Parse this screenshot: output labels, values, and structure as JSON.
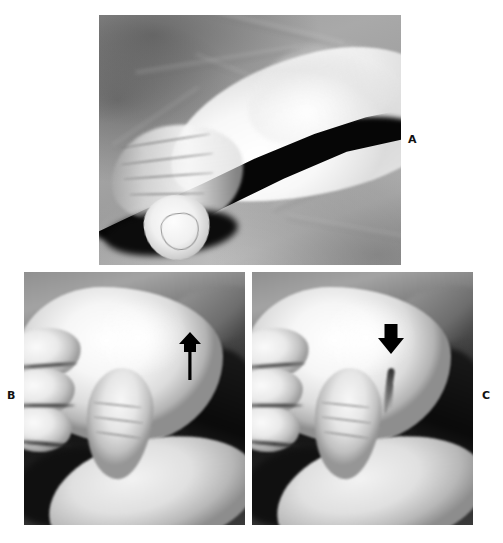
{
  "figure": {
    "background_color": "#ffffff",
    "width": 503,
    "height": 543,
    "label_color": "#111111"
  },
  "panels": [
    {
      "id": "a",
      "label": "A",
      "label_position": "right",
      "description": "Lateral view of a hand and wrist resting on a draped sheet, with a dark shadow band beneath the limb",
      "arrow": null
    },
    {
      "id": "b",
      "label": "B",
      "label_position": "left",
      "description": "Close-up dorsal view of a clenched hand with an examiner's thumb below; thin arrow with tail pointing upward at the metacarpal head",
      "arrow": {
        "direction": "up",
        "color": "#000000",
        "style": "slim-with-tail"
      }
    },
    {
      "id": "c",
      "label": "C",
      "label_position": "right",
      "description": "Close-up dorsal view of the same hand; short solid arrow pointing downward at the depression between metacarpal heads",
      "arrow": {
        "direction": "down",
        "color": "#000000",
        "style": "solid-block"
      }
    }
  ]
}
